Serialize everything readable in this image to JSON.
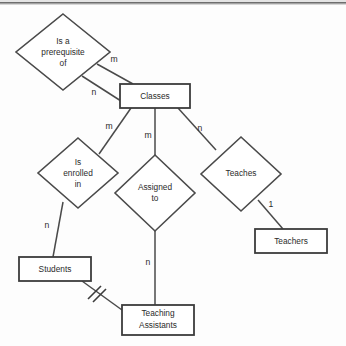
{
  "diagram": {
    "type": "entity-relationship-diagram",
    "title": "",
    "entities": [
      {
        "id": "classes",
        "label": "Classes",
        "lines": [
          "Classes"
        ],
        "shape": "rectangle",
        "cx": 155,
        "cy": 96,
        "w": 70,
        "h": 24
      },
      {
        "id": "students",
        "label": "Students",
        "lines": [
          "Students"
        ],
        "shape": "rectangle",
        "cx": 55,
        "cy": 269,
        "w": 72,
        "h": 24
      },
      {
        "id": "teachers",
        "label": "Teachers",
        "lines": [
          "Teachers"
        ],
        "shape": "rectangle",
        "cx": 291,
        "cy": 241,
        "w": 72,
        "h": 24
      },
      {
        "id": "tas",
        "label": "Teaching Assistants",
        "lines": [
          "Teaching",
          "Assistants"
        ],
        "shape": "rectangle",
        "cx": 158,
        "cy": 320,
        "w": 72,
        "h": 30
      }
    ],
    "relationships": [
      {
        "id": "prereq",
        "label": "Is a prerequisite of",
        "lines": [
          "Is a",
          "prerequisite",
          "of"
        ],
        "shape": "diamond",
        "cx": 63,
        "cy": 52,
        "rx": 47,
        "ry": 38
      },
      {
        "id": "enrolled",
        "label": "Is enrolled in",
        "lines": [
          "Is",
          "enrolled",
          "in"
        ],
        "shape": "diamond",
        "cx": 78,
        "cy": 173,
        "rx": 40,
        "ry": 35
      },
      {
        "id": "assigned",
        "label": "Assigned to",
        "lines": [
          "Assigned",
          "to"
        ],
        "shape": "diamond",
        "cx": 155,
        "cy": 193,
        "rx": 40,
        "ry": 38
      },
      {
        "id": "teaches",
        "label": "Teaches",
        "lines": [
          "Teaches"
        ],
        "shape": "diamond",
        "cx": 241,
        "cy": 174,
        "rx": 40,
        "ry": 37
      }
    ],
    "edges": [
      {
        "id": "prereq-classes-m",
        "from": "prereq",
        "to": "classes",
        "cardinality": "m",
        "x1": 97,
        "y1": 64,
        "x2": 133,
        "y2": 84,
        "lx": 114,
        "ly": 60
      },
      {
        "id": "prereq-classes-n",
        "from": "prereq",
        "to": "classes",
        "cardinality": "n",
        "x1": 82,
        "y1": 76,
        "x2": 121,
        "y2": 101,
        "lx": 94,
        "ly": 93
      },
      {
        "id": "classes-enrolled",
        "from": "classes",
        "to": "enrolled",
        "cardinality": "m",
        "x1": 131,
        "y1": 108,
        "x2": 99,
        "y2": 154,
        "lx": 109,
        "ly": 127
      },
      {
        "id": "classes-assigned",
        "from": "classes",
        "to": "assigned",
        "cardinality": "m",
        "x1": 155,
        "y1": 108,
        "x2": 155,
        "y2": 156,
        "lx": 148,
        "ly": 136
      },
      {
        "id": "classes-teaches",
        "from": "classes",
        "to": "teaches",
        "cardinality": "n",
        "x1": 178,
        "y1": 108,
        "x2": 216,
        "y2": 150,
        "lx": 200,
        "ly": 129
      },
      {
        "id": "enrolled-students",
        "from": "enrolled",
        "to": "students",
        "cardinality": "n",
        "x1": 63,
        "y1": 202,
        "x2": 53,
        "y2": 257,
        "lx": 47,
        "ly": 226
      },
      {
        "id": "assigned-tas",
        "from": "assigned",
        "to": "tas",
        "cardinality": "n",
        "x1": 155,
        "y1": 231,
        "x2": 155,
        "y2": 305,
        "lx": 148,
        "ly": 263
      },
      {
        "id": "teaches-teachers",
        "from": "teaches",
        "to": "teachers",
        "cardinality": "1",
        "x1": 258,
        "y1": 200,
        "x2": 283,
        "y2": 229,
        "lx": 271,
        "ly": 205
      },
      {
        "id": "students-tas",
        "from": "students",
        "to": "tas",
        "cardinality": "",
        "x1": 82,
        "y1": 281,
        "x2": 122,
        "y2": 310,
        "lx": 0,
        "ly": 0
      }
    ],
    "notation": {
      "double_tick_edge": "students-tas",
      "double_tick_label": "double-hash-mark"
    },
    "colors": {
      "stroke": "#4a4a4a",
      "box_stroke": "#3c3c3c",
      "fill": "#ffffff",
      "text": "#2b2b2b",
      "background": "#fdfdfd",
      "scan_band": "#6e6e6e"
    }
  }
}
